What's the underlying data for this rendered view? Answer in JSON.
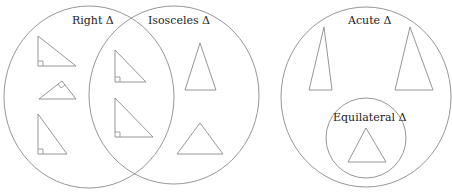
{
  "diagram": {
    "colors": {
      "stroke": "#8a8a8a",
      "text": "#222222",
      "background": "#ffffff"
    },
    "sets": [
      {
        "id": "right",
        "label": "Right Δ"
      },
      {
        "id": "isosceles",
        "label": "Isosceles Δ"
      },
      {
        "id": "acute",
        "label": "Acute Δ"
      },
      {
        "id": "equilateral",
        "label": "Equilateral Δ",
        "subset_of": "acute"
      }
    ],
    "regions": [
      {
        "region": "right only",
        "triangles": 3
      },
      {
        "region": "right and isosceles",
        "triangles": 2
      },
      {
        "region": "isosceles only",
        "triangles": 2
      },
      {
        "region": "acute only",
        "triangles": 2
      },
      {
        "region": "equilateral",
        "triangles": 1
      }
    ]
  }
}
